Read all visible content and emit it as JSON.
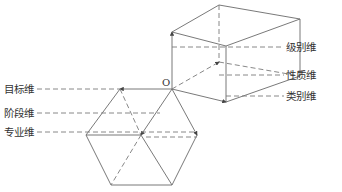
{
  "diagram": {
    "origin_label": "O",
    "right_labels": [
      {
        "id": "level",
        "text": "级别维"
      },
      {
        "id": "nature",
        "text": "性质维"
      },
      {
        "id": "category",
        "text": "类别维"
      }
    ],
    "left_labels": [
      {
        "id": "goal",
        "text": "目标维"
      },
      {
        "id": "stage",
        "text": "阶段维"
      },
      {
        "id": "specialty",
        "text": "专业维"
      }
    ],
    "line_color": "#6a6a6a",
    "text_color": "#333333"
  }
}
